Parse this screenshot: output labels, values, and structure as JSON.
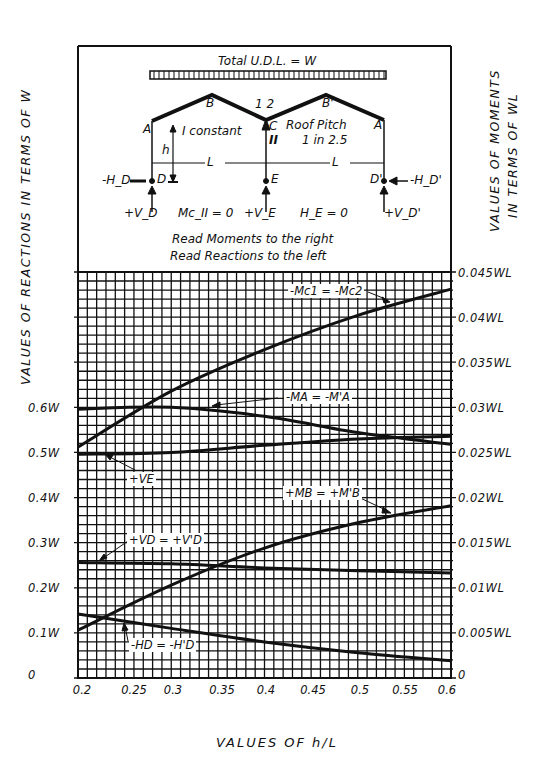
{
  "diagram": {
    "load_label": "Total U.D.L. = W",
    "node_labels": {
      "A": "A",
      "B": "B",
      "C": "C",
      "B_prime": "B'",
      "A_prime": "A",
      "D": "D",
      "E": "E",
      "D_prime": "D'"
    },
    "slope_marks": "1 2",
    "column_label": "II",
    "stiffness_note": "I constant",
    "height_label": "h",
    "span_label_1": "L",
    "span_label_2": "L",
    "roof_pitch_line1": "Roof Pitch",
    "roof_pitch_line2": "1 in 2.5",
    "reaction_HD": "-H_D",
    "reaction_HD_prime": "-H_D'",
    "reaction_VD": "+V_D",
    "reaction_VE": "+V_E",
    "reaction_VD_prime": "+V_D'",
    "condition_moment": "Mc_II = 0",
    "condition_horizontal": "H_E = 0",
    "note_moments": "Read Moments to the right",
    "note_reactions": "Read Reactions to the left"
  },
  "chart_data": {
    "type": "line",
    "xlabel": "VALUES OF h/L",
    "ylabel_left": "VALUES OF REACTIONS IN TERMS OF W",
    "ylabel_right": "VALUES OF MOMENTS IN TERMS OF WL",
    "x_ticks": [
      "0.2",
      "0.25",
      "0.3",
      "0.35",
      "0.4",
      "0.45",
      "0.5",
      "0.55",
      "0.6"
    ],
    "y_left_ticks": [
      "0",
      "0.1W",
      "0.2W",
      "0.3W",
      "0.4W",
      "0.5W",
      "0.6W"
    ],
    "y_right_ticks": [
      "0",
      "0.005WL",
      "0.01WL",
      "0.015WL",
      "0.02WL",
      "0.025WL",
      "0.03WL",
      "0.035WL",
      "0.04WL",
      "0.045WL"
    ],
    "xlim": [
      0.2,
      0.6
    ],
    "ylim_left": [
      0,
      0.9
    ],
    "ylim_right": [
      0,
      0.045
    ],
    "grid": true,
    "legend_position": "inline labels with leader arrows",
    "x": [
      0.2,
      0.3,
      0.4,
      0.5,
      0.6
    ],
    "series": [
      {
        "name": "-Mc1 = -Mc2",
        "axis": "right",
        "unit": "WL",
        "values": [
          0.0256,
          0.0318,
          0.0364,
          0.0402,
          0.0431
        ]
      },
      {
        "name": "-MA = -M'A",
        "axis": "right",
        "unit": "WL",
        "values": [
          0.0298,
          0.03,
          0.029,
          0.0272,
          0.0259
        ]
      },
      {
        "name": "+VE",
        "axis": "left",
        "unit": "W",
        "values": [
          0.496,
          0.5,
          0.516,
          0.53,
          0.536
        ]
      },
      {
        "name": "+MB = +M'B",
        "axis": "right",
        "unit": "WL",
        "values": [
          0.0053,
          0.0103,
          0.0144,
          0.0172,
          0.0191
        ]
      },
      {
        "name": "+VD = +V'D",
        "axis": "left",
        "unit": "W",
        "values": [
          0.256,
          0.253,
          0.244,
          0.238,
          0.233
        ]
      },
      {
        "name": "-HD = -H'D",
        "axis": "left",
        "unit": "W",
        "values": [
          0.142,
          0.11,
          0.08,
          0.056,
          0.038
        ]
      }
    ]
  }
}
